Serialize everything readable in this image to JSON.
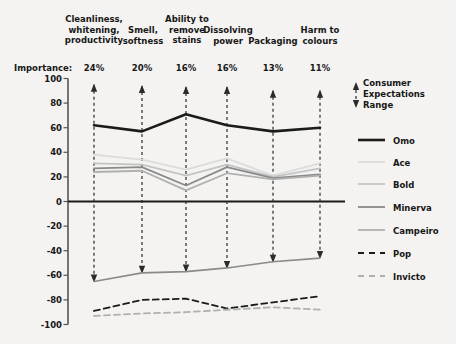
{
  "chart_data": {
    "type": "line",
    "title": "",
    "xlabel": "",
    "ylabel": "",
    "ylim": [
      -100,
      100
    ],
    "grid": false,
    "legend_position": "right",
    "categories": [
      "Cleanliness,\nwhitening,\nproductivity",
      "Smell,\nsoftness",
      "Ability to\nremove\nstains",
      "Dissolving\npower",
      "Packaging",
      "Harm to\ncolours"
    ],
    "importance_label": "Importance:",
    "importance": [
      "24%",
      "20%",
      "16%",
      "16%",
      "13%",
      "11%"
    ],
    "yticks": [
      100,
      80,
      60,
      40,
      20,
      0,
      -20,
      -40,
      -60,
      -80,
      -100
    ],
    "ytick_labels": [
      "100",
      "80",
      "60",
      "40",
      "20",
      "0",
      "-20",
      "-40",
      "-60",
      "-80",
      "-100"
    ],
    "series": [
      {
        "name": "Omo",
        "values": [
          62,
          57,
          71,
          62,
          57,
          60
        ],
        "color": "#1b1b1b",
        "width": 2.6,
        "dash": "none"
      },
      {
        "name": "Ace",
        "values": [
          38,
          34,
          26,
          35,
          21,
          31
        ],
        "color": "#dcdcdc",
        "width": 1.8,
        "dash": "none"
      },
      {
        "name": "Bold",
        "values": [
          31,
          30,
          21,
          30,
          20,
          27
        ],
        "color": "#c4c4c4",
        "width": 1.8,
        "dash": "none"
      },
      {
        "name": "Minerva",
        "values": [
          27,
          28,
          13,
          28,
          19,
          22
        ],
        "color": "#8a8a8a",
        "width": 1.8,
        "dash": "none"
      },
      {
        "name": "Campeiro",
        "values": [
          24,
          25,
          9,
          23,
          18,
          21
        ],
        "color": "#b0b0b0",
        "width": 1.8,
        "dash": "none"
      },
      {
        "name": "Pop",
        "values": [
          -89,
          -80,
          -79,
          -87,
          -82,
          -77
        ],
        "color": "#1b1b1b",
        "width": 1.8,
        "dash": "6 4"
      },
      {
        "name": "Invicto",
        "values": [
          -93,
          -91,
          -90,
          -88,
          -86,
          "-88"
        ],
        "color": "#b0b0b0",
        "width": 1.8,
        "dash": "6 4"
      }
    ],
    "range_series": {
      "name": "Campeiro range line",
      "values": [
        -65,
        -58,
        -57,
        -54,
        -49,
        -46
      ],
      "color": "#8a8a8a"
    },
    "consumer_expectations": {
      "label": "Consumer\nExpectations\nRange",
      "upper": [
        95,
        94,
        93,
        93,
        90,
        90
      ],
      "lower": [
        -65,
        -58,
        -57,
        -54,
        -49,
        -46
      ],
      "dash_color": "#2b2b2b"
    },
    "axis_color": "#555555",
    "zero_line_value": 0
  },
  "legend": {
    "consumer": "Consumer\nExpectations\nRange",
    "items": [
      {
        "label": "Omo"
      },
      {
        "label": "Ace"
      },
      {
        "label": "Bold"
      },
      {
        "label": "Minerva"
      },
      {
        "label": "Campeiro"
      },
      {
        "label": "Pop"
      },
      {
        "label": "Invicto"
      }
    ]
  }
}
